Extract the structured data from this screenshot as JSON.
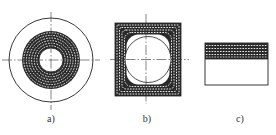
{
  "figure": {
    "subfigures": [
      {
        "id": "a",
        "label": "a)",
        "shape": "concentric-circular-winding",
        "description": "Outer circle enclosing a circular banded (hatched) winding ring around a central hole, with crosshair centerlines"
      },
      {
        "id": "b",
        "label": "b)",
        "shape": "square-winding-with-circular-bore",
        "description": "Square banded (hatched) winding with rounded inner corners surrounding a circular bore, with crosshair centerlines"
      },
      {
        "id": "c",
        "label": "c)",
        "shape": "rectangular-section-layered-winding",
        "description": "Rectangular section with banded (hatched) winding layers along the top portion"
      }
    ],
    "caption": ""
  },
  "colors": {
    "line": "#222222",
    "band_fill": "#2a2a2a",
    "band_dash": "#ffffff",
    "background": "#ffffff"
  }
}
